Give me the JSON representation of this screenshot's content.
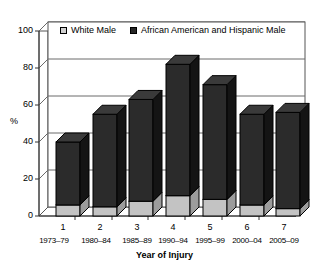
{
  "chart_data": {
    "type": "bar",
    "subtype": "stacked-3d-column",
    "title": "",
    "xlabel": "Year of Injury",
    "ylabel": "%",
    "ylim": [
      0,
      100
    ],
    "yticks": [
      0,
      20,
      40,
      60,
      80,
      100
    ],
    "grid": true,
    "legend_position": "top-inside",
    "categories": [
      "1",
      "2",
      "3",
      "4",
      "5",
      "6",
      "7"
    ],
    "category_sublabels": [
      "1973–79",
      "1980–84",
      "1985–89",
      "1990–94",
      "1995–99",
      "2000–04",
      "2005–09"
    ],
    "series": [
      {
        "name": "White Male",
        "color": "#c3c3c3",
        "values": [
          6,
          5,
          8,
          11,
          9,
          6,
          4
        ]
      },
      {
        "name": "African American and Hispanic Male",
        "color": "#2b2b2b",
        "values": [
          34,
          50,
          55,
          71,
          62,
          49,
          52
        ]
      }
    ],
    "stack_totals": [
      40,
      55,
      63,
      82,
      71,
      55,
      56
    ]
  },
  "legend": {
    "items": [
      {
        "label": "White Male",
        "marker": "legend-swatch-light"
      },
      {
        "label": "African American and Hispanic Male",
        "marker": "legend-swatch-dark"
      }
    ]
  },
  "axes": {
    "y": {
      "label": "%",
      "ticks": [
        "100",
        "80",
        "60",
        "40",
        "20",
        "0"
      ]
    },
    "x": {
      "title": "Year of Injury",
      "numbers": [
        "1",
        "2",
        "3",
        "4",
        "5",
        "6",
        "7"
      ],
      "years": [
        "1973–79",
        "1980–84",
        "1985–89",
        "1990–94",
        "1995–99",
        "2000–04",
        "2005–09"
      ]
    }
  },
  "colors": {
    "white_male": "#c3c3c3",
    "minority_male": "#2b2b2b",
    "grid": "#6a6a6a",
    "background": "#ffffff"
  }
}
